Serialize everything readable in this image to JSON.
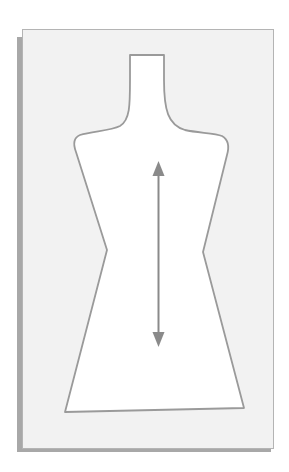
{
  "diagram": {
    "colors": {
      "background": "#ffffff",
      "card": "#f2f2f2",
      "card_border": "#b4b4b4",
      "shadow": "#a8a8a8",
      "piece_fill": "#ffffff",
      "outline": "#9a9a9a",
      "grainline": "#8a8a8a"
    },
    "annotations": {
      "grainline_arrow": "double-headed vertical arrow"
    }
  }
}
